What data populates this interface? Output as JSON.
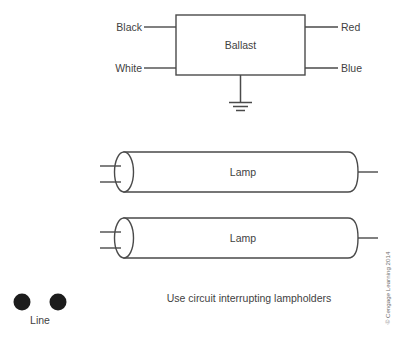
{
  "diagram": {
    "ballast": {
      "label": "Ballast",
      "leads": {
        "top_left": "Black",
        "bottom_left": "White",
        "top_right": "Red",
        "bottom_right": "Blue"
      },
      "ground_symbol": "earth-ground"
    },
    "lamps": [
      {
        "label": "Lamp"
      },
      {
        "label": "Lamp"
      }
    ],
    "line_terminals": {
      "label": "Line",
      "count": 2
    },
    "caption": "Use circuit interrupting lampholders",
    "credit": "© Cengage Learning 2014",
    "colors": {
      "stroke": "#4a4a4a",
      "text": "#3f3f3f",
      "terminal": "#1c1c1c",
      "background": "#ffffff"
    }
  }
}
